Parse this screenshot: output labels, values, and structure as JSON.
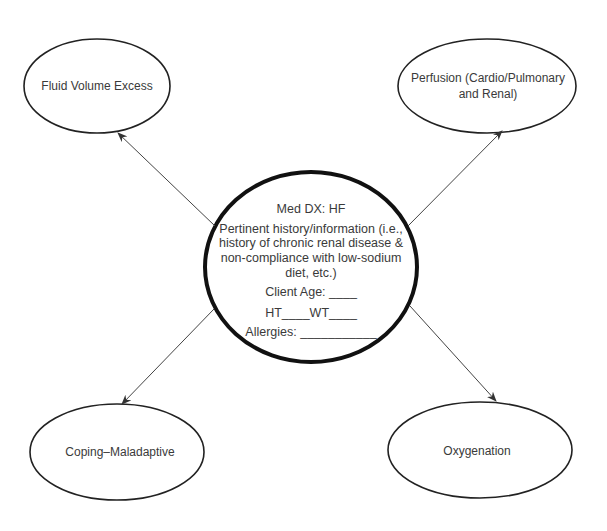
{
  "diagram": {
    "type": "concept-map",
    "center": {
      "title": "Med DX: HF",
      "history_lines": [
        "Pertinent history/information (i.e.,",
        "history of chronic renal disease &",
        "non-compliance with low-sodium",
        "diet, etc.)"
      ],
      "client_age": "Client Age: ____",
      "height_weight": "HT____WT____",
      "allergies": "Allergies: ___________"
    },
    "nodes": [
      {
        "id": "top-left",
        "label": "Fluid Volume Excess"
      },
      {
        "id": "top-right",
        "label_lines": [
          "Perfusion (Cardio/Pulmonary",
          "and Renal)"
        ]
      },
      {
        "id": "bottom-left",
        "label": "Coping–Maladaptive"
      },
      {
        "id": "bottom-right",
        "label": "Oxygenation"
      }
    ],
    "colors": {
      "stroke": "#222222",
      "arrow": "#444444",
      "text": "#3a3a3a",
      "background": "#ffffff"
    }
  }
}
